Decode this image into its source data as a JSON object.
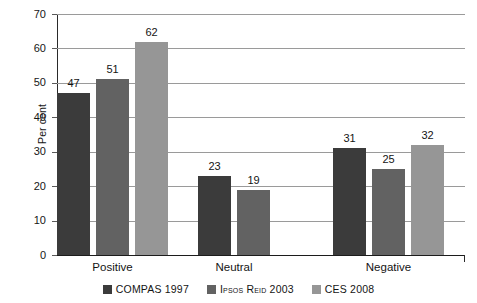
{
  "chart_data": {
    "type": "bar",
    "title": "",
    "xlabel": "",
    "ylabel": "Per cent",
    "ylim": [
      0,
      70
    ],
    "ytick_step": 10,
    "yticks": [
      "0",
      "10",
      "20",
      "30",
      "40",
      "50",
      "60",
      "70"
    ],
    "grid": true,
    "legend_position": "bottom-center",
    "categories": [
      "Positive",
      "Neutral",
      "Negative"
    ],
    "series": [
      {
        "name": "COMPAS 1997",
        "color": "#3b3b3b",
        "values": [
          47,
          23,
          31
        ]
      },
      {
        "name": "Ipsos Reid 2003",
        "color": "#626262",
        "values": [
          51,
          19,
          25
        ]
      },
      {
        "name": "CES 2008",
        "color": "#969696",
        "values": [
          62,
          null,
          32
        ]
      }
    ],
    "data_labels": {
      "Positive": [
        "47",
        "51",
        "62"
      ],
      "Neutral": [
        "23",
        "19",
        null
      ],
      "Negative": [
        "31",
        "25",
        "32"
      ]
    }
  },
  "axis": {
    "y_title": "Per cent"
  },
  "legend": {
    "items": [
      {
        "label": "COMPAS 1997",
        "color": "#3b3b3b"
      },
      {
        "label": "Ipsos Reid 2003",
        "color": "#626262"
      },
      {
        "label": "CES 2008",
        "color": "#969696"
      }
    ]
  }
}
